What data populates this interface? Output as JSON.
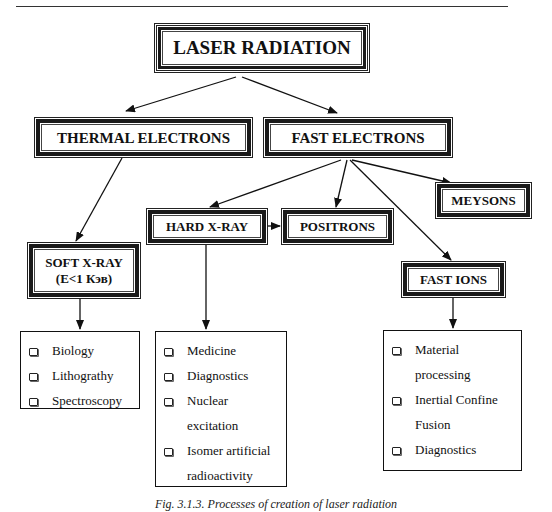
{
  "diagram": {
    "root": {
      "label": "LASER RADIATION"
    },
    "level1": [
      {
        "id": "thermal",
        "label": "THERMAL ELECTRONS"
      },
      {
        "id": "fast",
        "label": "FAST ELECTRONS"
      }
    ],
    "level2": [
      {
        "id": "soft_xray",
        "label": "SOFT X-RAY",
        "sublabel": "(E<1 Кэв)"
      },
      {
        "id": "hard_xray",
        "label": "HARD X-RAY"
      },
      {
        "id": "positrons",
        "label": "POSITRONS"
      },
      {
        "id": "meysons",
        "label": "MEYSONS"
      },
      {
        "id": "fast_ions",
        "label": "FAST IONS"
      }
    ],
    "applications": {
      "soft_xray": [
        "Biology",
        "Lithograthy",
        "Spectroscopy"
      ],
      "hard_xray": [
        "Medicine",
        "Diagnostics",
        "Nuclear excitation",
        "Isomer artificial radioactivity"
      ],
      "fast_ions": [
        "Material processing",
        "Inertial Confine Fusion",
        "Diagnostics"
      ]
    },
    "edges": [
      [
        "LASER RADIATION",
        "THERMAL ELECTRONS"
      ],
      [
        "LASER RADIATION",
        "FAST ELECTRONS"
      ],
      [
        "THERMAL ELECTRONS",
        "SOFT X-RAY"
      ],
      [
        "FAST ELECTRONS",
        "HARD X-RAY"
      ],
      [
        "FAST ELECTRONS",
        "POSITRONS"
      ],
      [
        "FAST ELECTRONS",
        "MEYSONS"
      ],
      [
        "FAST ELECTRONS",
        "FAST IONS"
      ],
      [
        "HARD X-RAY",
        "POSITRONS"
      ],
      [
        "SOFT X-RAY",
        "soft x-ray applications"
      ],
      [
        "HARD X-RAY",
        "hard x-ray applications"
      ],
      [
        "FAST IONS",
        "fast ions applications"
      ]
    ]
  },
  "caption": "Fig. 3.1.3. Processes of creation of laser radiation",
  "colors": {
    "ink": "#111111",
    "background": "#ffffff"
  }
}
